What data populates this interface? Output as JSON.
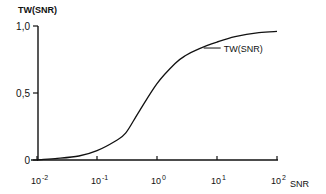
{
  "chart_data": {
    "type": "line",
    "title": "",
    "xlabel": "SNR",
    "ylabel": "TW(SNR)",
    "xscale": "log",
    "xlim": [
      0.01,
      100
    ],
    "ylim": [
      0,
      1.0
    ],
    "x_ticks": [
      {
        "value": 0.01,
        "base": "10",
        "exp": "-2"
      },
      {
        "value": 0.1,
        "base": "10",
        "exp": "-1"
      },
      {
        "value": 1,
        "base": "10",
        "exp": "0"
      },
      {
        "value": 10,
        "base": "10",
        "exp": "1"
      },
      {
        "value": 100,
        "base": "10",
        "exp": "2"
      }
    ],
    "y_ticks": [
      {
        "value": 0,
        "label": "0"
      },
      {
        "value": 0.5,
        "label": "0,5"
      },
      {
        "value": 1.0,
        "label": "1,0"
      }
    ],
    "grid": false,
    "series": [
      {
        "name": "TW(SNR)",
        "x": [
          0.01,
          0.02,
          0.05,
          0.1,
          0.2,
          0.3,
          0.5,
          1,
          2,
          3,
          5,
          10,
          20,
          50,
          100
        ],
        "y": [
          0.0,
          0.01,
          0.03,
          0.07,
          0.14,
          0.2,
          0.36,
          0.57,
          0.72,
          0.78,
          0.83,
          0.88,
          0.92,
          0.95,
          0.96
        ]
      }
    ],
    "annotations": [
      {
        "text": "TW(SNR)",
        "points_to_series": "TW(SNR)",
        "near_x": 6
      }
    ]
  }
}
